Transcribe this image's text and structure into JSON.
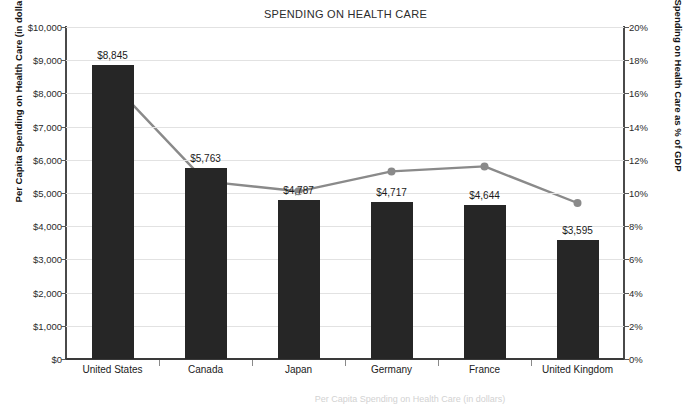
{
  "chart_data": {
    "type": "bar",
    "title": "SPENDING ON HEALTH CARE",
    "xlabel": "",
    "categories": [
      "United States",
      "Canada",
      "Japan",
      "Germany",
      "France",
      "United Kingdom"
    ],
    "series": [
      {
        "name": "Per Capita Spending on Health Care (in dollars)",
        "type": "bar",
        "axis": "left",
        "values": [
          8845,
          5763,
          4787,
          4717,
          4644,
          3595
        ],
        "data_labels": [
          "$8,845",
          "$5,763",
          "$4,787",
          "$4,717",
          "$4,644",
          "$3,595"
        ],
        "color": "#262626"
      },
      {
        "name": "Spending on Health Care as % of GDP",
        "type": "line",
        "axis": "right",
        "values": [
          16.6,
          10.7,
          10.1,
          11.3,
          11.6,
          9.4
        ],
        "color": "#8a8a8a"
      }
    ],
    "left_axis": {
      "label": "Per Capita Spending on Health Care (in dollars)",
      "ylim": [
        0,
        10000
      ],
      "step": 1000,
      "ticks": [
        "$0",
        "$1,000",
        "$2,000",
        "$3,000",
        "$4,000",
        "$5,000",
        "$6,000",
        "$7,000",
        "$8,000",
        "$9,000",
        "$10,000"
      ]
    },
    "right_axis": {
      "label": "Spending on Health Care as % of GDP",
      "ylim": [
        0,
        20
      ],
      "step": 2,
      "ticks": [
        "0%",
        "2%",
        "4%",
        "6%",
        "8%",
        "10%",
        "12%",
        "14%",
        "16%",
        "18%",
        "20%"
      ]
    },
    "grid": true,
    "legend": "none"
  },
  "caption": {
    "text": "Per Capita Spending on Health Care (in dollars)"
  }
}
